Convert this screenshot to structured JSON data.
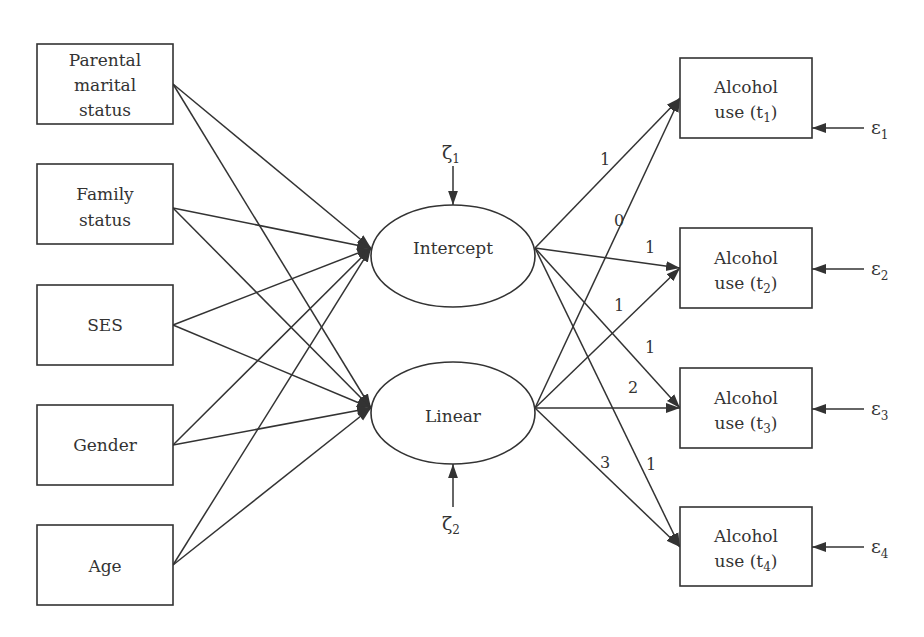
{
  "diagram": {
    "type": "latent growth curve model path diagram",
    "predictors": [
      {
        "id": "parental_marital_status",
        "lines": [
          "Parental",
          "marital",
          "status"
        ]
      },
      {
        "id": "family_status",
        "lines": [
          "Family",
          "status"
        ]
      },
      {
        "id": "ses",
        "lines": [
          "SES"
        ]
      },
      {
        "id": "gender",
        "lines": [
          "Gender"
        ]
      },
      {
        "id": "age",
        "lines": [
          "Age"
        ]
      }
    ],
    "latent_factors": [
      {
        "id": "intercept",
        "label": "Intercept",
        "disturbance": {
          "symbol": "ζ",
          "subscript": "1"
        }
      },
      {
        "id": "linear",
        "label": "Linear",
        "disturbance": {
          "symbol": "ζ",
          "subscript": "2"
        }
      }
    ],
    "outcomes": [
      {
        "id": "t1",
        "line1": "Alcohol",
        "line2_prefix": "use (t",
        "subscript": "1",
        "line2_suffix": ")",
        "error": {
          "symbol": "ε",
          "subscript": "1"
        }
      },
      {
        "id": "t2",
        "line1": "Alcohol",
        "line2_prefix": "use (t",
        "subscript": "2",
        "line2_suffix": ")",
        "error": {
          "symbol": "ε",
          "subscript": "2"
        }
      },
      {
        "id": "t3",
        "line1": "Alcohol",
        "line2_prefix": "use (t",
        "subscript": "3",
        "line2_suffix": ")",
        "error": {
          "symbol": "ε",
          "subscript": "3"
        }
      },
      {
        "id": "t4",
        "line1": "Alcohol",
        "line2_prefix": "use (t",
        "subscript": "4",
        "line2_suffix": ")",
        "error": {
          "symbol": "ε",
          "subscript": "4"
        }
      }
    ],
    "loadings": {
      "intercept": [
        "1",
        "1",
        "1",
        "1"
      ],
      "linear": [
        "0",
        "1",
        "2",
        "3"
      ]
    },
    "paths_predictors_to_factors": "every predictor has a directed path to both Intercept and Linear"
  }
}
